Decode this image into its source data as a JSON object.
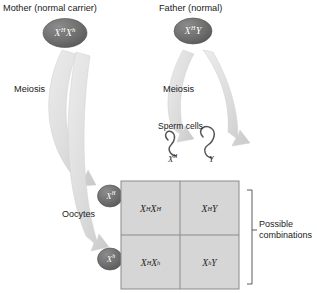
{
  "figure": {
    "type": "genetic-cross-punnett-square"
  },
  "parents": {
    "mother": {
      "title": "Mother (normal carrier)",
      "genotype_plain": "X^H X^h",
      "allele1": "X",
      "allele1_sup": "H",
      "allele2": "X",
      "allele2_sup": "h"
    },
    "father": {
      "title": "Father (normal)",
      "genotype_plain": "X^H Y",
      "allele1": "X",
      "allele1_sup": "H",
      "allele2": "Y",
      "allele2_sup": ""
    }
  },
  "process": {
    "meiosis_left": "Meiosis",
    "meiosis_right": "Meiosis"
  },
  "gametes": {
    "sperm_title": "Sperm cells",
    "sperm": [
      {
        "label_base": "X",
        "label_sup": "H",
        "plain": "X^H"
      },
      {
        "label_base": "Y",
        "label_sup": "",
        "plain": "Y"
      }
    ],
    "oocytes_title": "Oocytes",
    "oocytes": [
      {
        "label_base": "X",
        "label_sup": "H",
        "plain": "X^H"
      },
      {
        "label_base": "X",
        "label_sup": "h",
        "plain": "X^h"
      }
    ]
  },
  "punnett": {
    "caption": "Possible\ncombinations",
    "caption_line1": "Possible",
    "caption_line2": "combinations",
    "rows": [
      [
        {
          "a1": "X",
          "s1": "H",
          "a2": "X",
          "s2": "H",
          "plain": "X^H X^H"
        },
        {
          "a1": "X",
          "s1": "H",
          "a2": "Y",
          "s2": "",
          "plain": "X^H Y"
        }
      ],
      [
        {
          "a1": "X",
          "s1": "H",
          "a2": "X",
          "s2": "h",
          "plain": "X^H X^h"
        },
        {
          "a1": "X",
          "s1": "h",
          "a2": "Y",
          "s2": "",
          "plain": "X^h Y"
        }
      ]
    ]
  },
  "colors": {
    "background": "#ffffff",
    "grid_fill": "#d6d6d6",
    "grid_line": "#8a8a8a",
    "circle_fill": "#6e6e6e",
    "arrow_fill": "#dcdcdc",
    "text": "#1a1a1a",
    "sperm_stroke": "#555555",
    "bracket": "#5a5a5a"
  }
}
